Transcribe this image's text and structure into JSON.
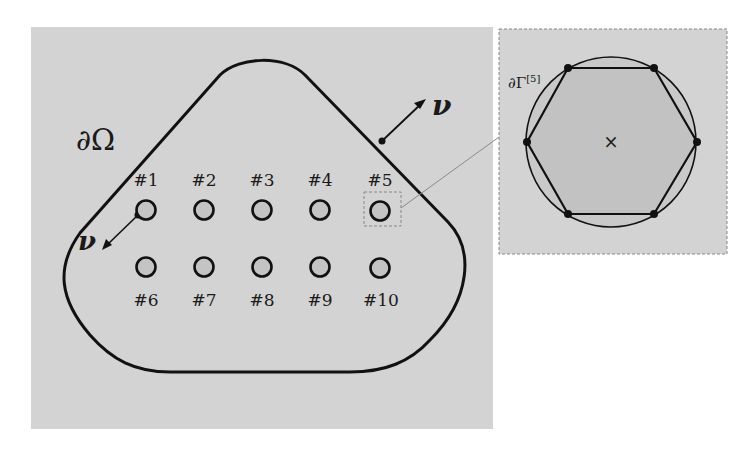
{
  "main_panel": {
    "background": "#d3d3d3",
    "domain_label": "∂Ω",
    "normal_label_outer": "ν",
    "normal_label_inner": "ν",
    "holes": [
      {
        "id": 1,
        "label": "#1",
        "cx": 146,
        "cy": 210
      },
      {
        "id": 2,
        "label": "#2",
        "cx": 204,
        "cy": 210
      },
      {
        "id": 3,
        "label": "#3",
        "cx": 262,
        "cy": 210
      },
      {
        "id": 4,
        "label": "#4",
        "cx": 320,
        "cy": 210
      },
      {
        "id": 5,
        "label": "#5",
        "cx": 380,
        "cy": 210
      },
      {
        "id": 6,
        "label": "#6",
        "cx": 146,
        "cy": 267
      },
      {
        "id": 7,
        "label": "#7",
        "cx": 204,
        "cy": 267
      },
      {
        "id": 8,
        "label": "#8",
        "cx": 262,
        "cy": 267
      },
      {
        "id": 9,
        "label": "#9",
        "cx": 320,
        "cy": 267
      },
      {
        "id": 10,
        "label": "#10",
        "cx": 380,
        "cy": 267
      }
    ],
    "highlighted_hole": 5
  },
  "inset_panel": {
    "background": "#d3d3d3",
    "boundary_label": "∂Γ",
    "boundary_superscript": "[5]",
    "center_marker": "×",
    "polygon_sides": 6
  },
  "colors": {
    "stroke": "#111111",
    "hole_fill": "#c4c4c4",
    "hexagon_fill": "#c6c6c6",
    "dashed": "#888888",
    "leader_line": "#8a8a8a"
  }
}
